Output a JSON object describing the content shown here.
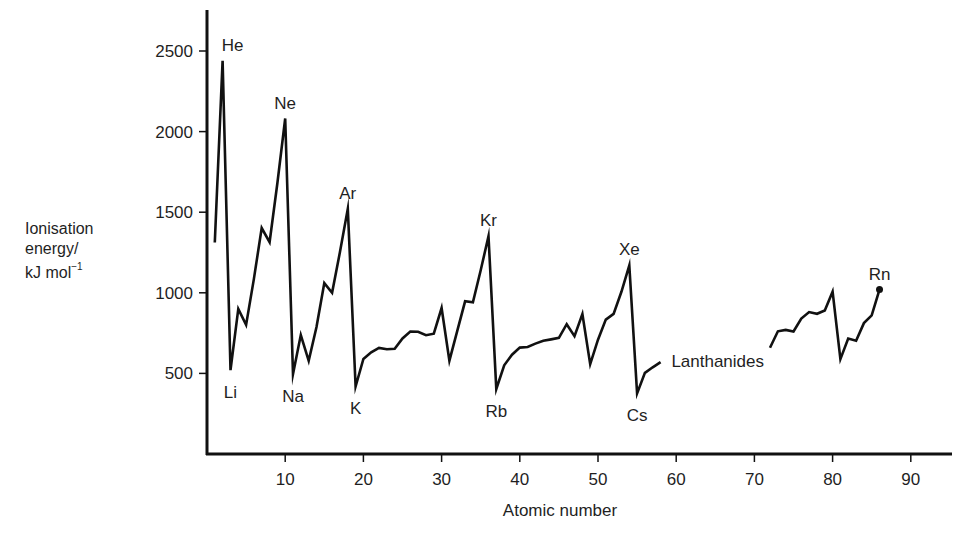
{
  "chart_data": {
    "type": "line",
    "title": "",
    "xlabel": "Atomic number",
    "ylabel": "Ionisation energy/ kJ mol⁻¹",
    "ylabel_lines": [
      "Ionisation",
      "energy/",
      "kJ mol"
    ],
    "ylabel_superscript": "−1",
    "xlim": [
      0,
      95
    ],
    "ylim": [
      0,
      2700
    ],
    "xticks": [
      10,
      20,
      30,
      40,
      50,
      60,
      70,
      80,
      90
    ],
    "yticks": [
      500,
      1000,
      1500,
      2000,
      2500
    ],
    "grid": false,
    "legend": null,
    "series": [
      {
        "name": "Periods 1-6 (to Ce)",
        "x": [
          1,
          2,
          3,
          4,
          5,
          6,
          7,
          8,
          9,
          10,
          11,
          12,
          13,
          14,
          15,
          16,
          17,
          18,
          19,
          20,
          21,
          22,
          23,
          24,
          25,
          26,
          27,
          28,
          29,
          30,
          31,
          32,
          33,
          34,
          35,
          36,
          37,
          38,
          39,
          40,
          41,
          42,
          43,
          44,
          45,
          46,
          47,
          48,
          49,
          50,
          51,
          52,
          53,
          54,
          55,
          56,
          57,
          58
        ],
        "values": [
          1312,
          2440,
          520,
          900,
          801,
          1086,
          1402,
          1314,
          1681,
          2081,
          496,
          738,
          578,
          787,
          1060,
          1000,
          1251,
          1521,
          419,
          590,
          631,
          658,
          650,
          653,
          717,
          759,
          758,
          737,
          746,
          906,
          579,
          762,
          947,
          941,
          1140,
          1351,
          403,
          550,
          616,
          660,
          664,
          685,
          702,
          711,
          720,
          805,
          731,
          868,
          558,
          709,
          834,
          869,
          1008,
          1170,
          376,
          503,
          538,
          570
        ]
      },
      {
        "name": "Period 6 (Hf to Rn)",
        "x": [
          72,
          73,
          74,
          75,
          76,
          77,
          78,
          79,
          80,
          81,
          82,
          83,
          84,
          85,
          86
        ],
        "values": [
          659,
          761,
          770,
          760,
          840,
          880,
          870,
          890,
          1007,
          589,
          716,
          703,
          812,
          860,
          1020
        ]
      }
    ],
    "annotations": [
      {
        "text": "He",
        "x": 2,
        "value": 2440,
        "pos": "above"
      },
      {
        "text": "Ne",
        "x": 10,
        "value": 2081,
        "pos": "above"
      },
      {
        "text": "Ar",
        "x": 18,
        "value": 1521,
        "pos": "above"
      },
      {
        "text": "Kr",
        "x": 36,
        "value": 1351,
        "pos": "above"
      },
      {
        "text": "Xe",
        "x": 54,
        "value": 1170,
        "pos": "above"
      },
      {
        "text": "Rn",
        "x": 86,
        "value": 1020,
        "pos": "above"
      },
      {
        "text": "Li",
        "x": 3,
        "value": 520,
        "pos": "below"
      },
      {
        "text": "Na",
        "x": 11,
        "value": 496,
        "pos": "below"
      },
      {
        "text": "K",
        "x": 19,
        "value": 419,
        "pos": "below"
      },
      {
        "text": "Rb",
        "x": 37,
        "value": 403,
        "pos": "below"
      },
      {
        "text": "Cs",
        "x": 55,
        "value": 376,
        "pos": "below"
      },
      {
        "text": "Lanthanides",
        "x": 59,
        "value": 580,
        "pos": "right"
      }
    ],
    "end_marker": {
      "x": 86,
      "value": 1020,
      "shape": "dot"
    }
  },
  "layout_hint": {
    "line_color": "#111111",
    "axis_color": "#111111",
    "text_color": "#1f1f1f"
  }
}
